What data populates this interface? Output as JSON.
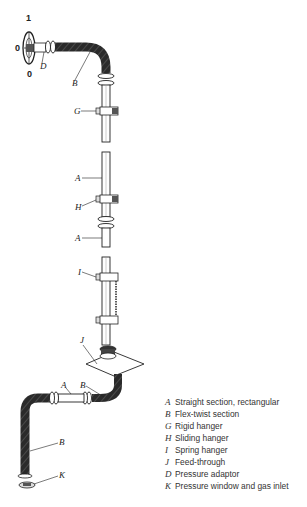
{
  "figure": {
    "dial_labels": {
      "top": "1",
      "left": "0",
      "bottom": "0"
    },
    "callouts": [
      {
        "key": "D",
        "x": 40,
        "y": 65
      },
      {
        "key": "B",
        "x": 71,
        "y": 82
      },
      {
        "key": "G",
        "x": 75,
        "y": 110
      },
      {
        "key": "A",
        "x": 75,
        "y": 178
      },
      {
        "key": "H",
        "x": 75,
        "y": 207
      },
      {
        "key": "A",
        "x": 75,
        "y": 238
      },
      {
        "key": "I",
        "x": 78,
        "y": 271
      },
      {
        "key": "J",
        "x": 79,
        "y": 340
      },
      {
        "key": "A",
        "x": 60,
        "y": 386
      },
      {
        "key": "B",
        "x": 80,
        "y": 384
      },
      {
        "key": "B",
        "x": 59,
        "y": 441
      },
      {
        "key": "K",
        "x": 59,
        "y": 474
      }
    ]
  },
  "legend": [
    {
      "key": "A",
      "text": "Straight section, rectangular"
    },
    {
      "key": "B",
      "text": "Flex-twist section"
    },
    {
      "key": "G",
      "text": "Rigid hanger"
    },
    {
      "key": "H",
      "text": "Sliding hanger"
    },
    {
      "key": "I",
      "text": "Spring hanger"
    },
    {
      "key": "J",
      "text": "Feed-through"
    },
    {
      "key": "D",
      "text": "Pressure adaptor"
    },
    {
      "key": "K",
      "text": "Pressure window and gas inlet"
    }
  ]
}
